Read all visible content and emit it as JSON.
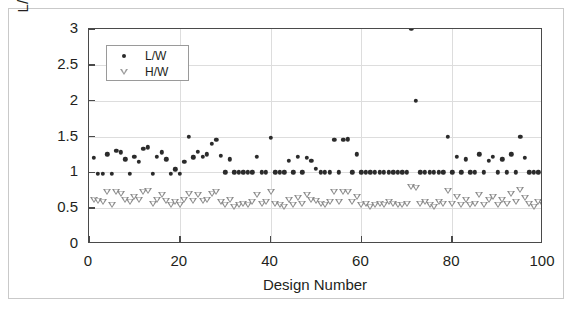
{
  "chart_data": {
    "type": "scatter",
    "title": "",
    "xlabel": "Design Number",
    "ylabel": "L/W & H/W Ratios",
    "xlim": [
      0,
      100
    ],
    "ylim": [
      0,
      3
    ],
    "xticks": [
      0,
      20,
      40,
      60,
      80,
      100
    ],
    "yticks": [
      0,
      0.5,
      1,
      1.5,
      2,
      2.5,
      3
    ],
    "xtick_labels": [
      "0",
      "20",
      "40",
      "60",
      "80",
      "100"
    ],
    "ytick_labels": [
      "0",
      "0.5",
      "1",
      "1.5",
      "2",
      "2.5",
      "3"
    ],
    "grid": true,
    "grid_color": "#dddddd",
    "legend_position": "upper-left-inside",
    "series": [
      {
        "name": "L/W",
        "marker": "filled-circle",
        "color": "#2b2b2b",
        "x": [
          1,
          2,
          3,
          4,
          5,
          6,
          7,
          8,
          9,
          10,
          11,
          12,
          13,
          14,
          15,
          16,
          17,
          18,
          19,
          20,
          21,
          22,
          23,
          24,
          25,
          26,
          27,
          28,
          29,
          30,
          31,
          32,
          33,
          34,
          35,
          36,
          37,
          38,
          39,
          40,
          41,
          42,
          43,
          44,
          45,
          46,
          47,
          48,
          49,
          50,
          51,
          52,
          53,
          54,
          55,
          56,
          57,
          58,
          59,
          60,
          61,
          62,
          63,
          64,
          65,
          66,
          67,
          68,
          69,
          70,
          71,
          72,
          73,
          74,
          75,
          76,
          77,
          78,
          79,
          80,
          81,
          82,
          83,
          84,
          85,
          86,
          87,
          88,
          89,
          90,
          91,
          92,
          93,
          94,
          95,
          96,
          97,
          98,
          99,
          100
        ],
        "y": [
          1.2,
          0.98,
          0.98,
          1.25,
          0.98,
          1.3,
          1.28,
          1.18,
          0.98,
          1.22,
          1.15,
          1.33,
          1.35,
          0.98,
          1.22,
          1.28,
          1.18,
          0.98,
          1.04,
          0.98,
          1.15,
          1.5,
          1.21,
          1.29,
          1.22,
          1.25,
          1.4,
          1.45,
          1.23,
          1.0,
          1.18,
          1.0,
          1.0,
          1.0,
          1.0,
          1.0,
          1.22,
          1.0,
          1.0,
          1.48,
          1.0,
          1.0,
          1.0,
          1.16,
          1.0,
          1.22,
          1.0,
          1.2,
          1.16,
          1.05,
          1.0,
          1.0,
          1.0,
          1.45,
          1.0,
          1.45,
          1.46,
          1.0,
          1.25,
          1.0,
          1.0,
          1.0,
          1.0,
          1.0,
          1.0,
          1.0,
          1.0,
          1.0,
          1.0,
          1.0,
          3.0,
          2.0,
          1.0,
          1.0,
          1.0,
          1.0,
          1.0,
          1.0,
          1.5,
          1.0,
          1.22,
          1.0,
          1.18,
          1.0,
          1.0,
          1.25,
          1.0,
          1.16,
          1.22,
          1.0,
          1.18,
          1.0,
          1.25,
          1.0,
          1.5,
          1.2,
          1.0,
          1.0,
          1.0,
          1.0
        ]
      },
      {
        "name": "H/W",
        "marker": "open-triangle-down",
        "color": "#8c8c8c",
        "x": [
          1,
          2,
          3,
          4,
          5,
          6,
          7,
          8,
          9,
          10,
          11,
          12,
          13,
          14,
          15,
          16,
          17,
          18,
          19,
          20,
          21,
          22,
          23,
          24,
          25,
          26,
          27,
          28,
          29,
          30,
          31,
          32,
          33,
          34,
          35,
          36,
          37,
          38,
          39,
          40,
          41,
          42,
          43,
          44,
          45,
          46,
          47,
          48,
          49,
          50,
          51,
          52,
          53,
          54,
          55,
          56,
          57,
          58,
          59,
          60,
          61,
          62,
          63,
          64,
          65,
          66,
          67,
          68,
          69,
          70,
          71,
          72,
          73,
          74,
          75,
          76,
          77,
          78,
          79,
          80,
          81,
          82,
          83,
          84,
          85,
          86,
          87,
          88,
          89,
          90,
          91,
          92,
          93,
          94,
          95,
          96,
          97,
          98,
          99,
          100
        ],
        "y": [
          0.62,
          0.6,
          0.58,
          0.72,
          0.55,
          0.72,
          0.7,
          0.62,
          0.58,
          0.66,
          0.62,
          0.72,
          0.74,
          0.56,
          0.62,
          0.68,
          0.6,
          0.54,
          0.58,
          0.55,
          0.62,
          0.7,
          0.6,
          0.68,
          0.6,
          0.62,
          0.7,
          0.72,
          0.58,
          0.55,
          0.62,
          0.52,
          0.55,
          0.56,
          0.54,
          0.58,
          0.68,
          0.56,
          0.58,
          0.72,
          0.56,
          0.54,
          0.52,
          0.62,
          0.55,
          0.64,
          0.56,
          0.68,
          0.62,
          0.6,
          0.56,
          0.54,
          0.58,
          0.72,
          0.58,
          0.72,
          0.72,
          0.58,
          0.66,
          0.55,
          0.56,
          0.52,
          0.55,
          0.56,
          0.54,
          0.58,
          0.56,
          0.55,
          0.54,
          0.56,
          0.8,
          0.78,
          0.56,
          0.58,
          0.54,
          0.52,
          0.58,
          0.56,
          0.74,
          0.56,
          0.66,
          0.55,
          0.62,
          0.54,
          0.56,
          0.68,
          0.55,
          0.62,
          0.66,
          0.54,
          0.62,
          0.56,
          0.7,
          0.58,
          0.76,
          0.64,
          0.56,
          0.52,
          0.58,
          0.55
        ]
      }
    ]
  },
  "legend": {
    "entries": [
      {
        "label": "L/W",
        "icon": "filled-circle-icon"
      },
      {
        "label": "H/W",
        "icon": "open-triangle-down-icon"
      }
    ]
  }
}
